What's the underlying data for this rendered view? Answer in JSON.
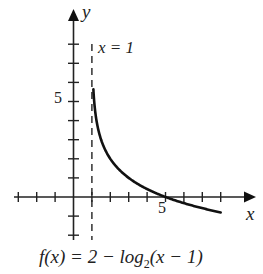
{
  "chart_data": {
    "type": "line",
    "title": "",
    "function": "f(x) = 2 − log2(x − 1)",
    "caption": "f(x) = 2 − log₂(x − 1)",
    "xlabel": "x",
    "ylabel": "y",
    "asymptote": {
      "type": "vertical",
      "x": 1,
      "label": "x = 1",
      "style": "dashed"
    },
    "xlim": [
      -3.3,
      9.7
    ],
    "ylim": [
      -2.3,
      9.8
    ],
    "x_ticks": [
      -3,
      -2,
      -1,
      1,
      2,
      3,
      4,
      5,
      6,
      7,
      8
    ],
    "y_ticks": [
      -2,
      -1,
      1,
      2,
      3,
      4,
      5,
      6,
      7,
      8
    ],
    "labeled_ticks": {
      "x": [
        "5"
      ],
      "y": [
        "5"
      ]
    },
    "grid": false,
    "x_intercept": 5,
    "series": [
      {
        "name": "f(x)",
        "x": [
          1.1,
          1.25,
          1.5,
          2,
          3,
          4,
          5,
          6,
          7,
          8
        ],
        "values": [
          5.32,
          4.0,
          3.0,
          2.0,
          1.0,
          0.42,
          0.0,
          -0.32,
          -0.58,
          -0.81
        ]
      }
    ]
  },
  "labels": {
    "x_axis": "x",
    "y_axis": "y",
    "asymptote": "x = 1",
    "tick_x_5": "5",
    "tick_y_5": "5",
    "caption_pre": "f(x) = 2 − log",
    "caption_sub": "2",
    "caption_post": "(x − 1)"
  }
}
